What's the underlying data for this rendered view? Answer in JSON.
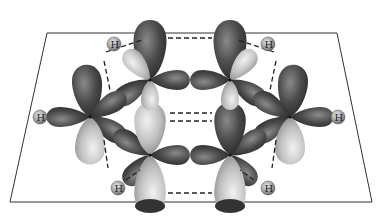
{
  "diagram": {
    "plane": {
      "corners": [
        [
          47,
          33
        ],
        [
          337,
          33
        ],
        [
          372,
          202
        ],
        [
          10,
          202
        ]
      ],
      "stroke": "#333333"
    },
    "colors": {
      "dark_lobe": "#4a4a4a",
      "light_lobe": "#c8c8c8",
      "hydrogen": "#9a9a9a",
      "dash": "#222222"
    },
    "carbons": [
      {
        "id": "C1",
        "x": 150,
        "y": 80
      },
      {
        "id": "C2",
        "x": 230,
        "y": 80
      },
      {
        "id": "C3",
        "x": 90,
        "y": 117
      },
      {
        "id": "C4",
        "x": 290,
        "y": 117
      },
      {
        "id": "C5",
        "x": 150,
        "y": 155
      },
      {
        "id": "C6",
        "x": 230,
        "y": 155
      }
    ],
    "hydrogens": [
      {
        "label": "H",
        "x": 114,
        "y": 44
      },
      {
        "label": "H",
        "x": 268,
        "y": 44
      },
      {
        "label": "H",
        "x": 40,
        "y": 117
      },
      {
        "label": "H",
        "x": 338,
        "y": 117
      },
      {
        "label": "H",
        "x": 118,
        "y": 188
      },
      {
        "label": "H",
        "x": 268,
        "y": 188
      }
    ]
  }
}
